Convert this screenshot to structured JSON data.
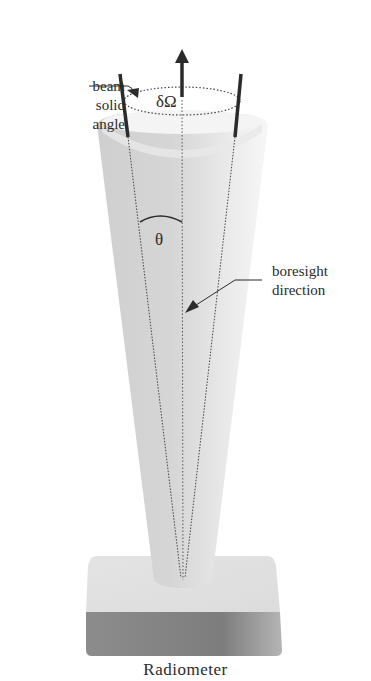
{
  "figure": {
    "type": "radiometer beam geometry diagram",
    "labels": {
      "beam_solid_angle": [
        "beam",
        "solid",
        "angle"
      ],
      "solid_angle_symbol": "δΩ",
      "angle_symbol": "θ",
      "boresight_direction": [
        "boresight",
        "direction"
      ],
      "instrument": "Radiometer"
    },
    "colors": {
      "background": "#ffffff",
      "cone_fill": "#d9d9d9",
      "base_top": "#e2e2e2",
      "base_front": "#8a8a8a",
      "lines": "#2b2b2b"
    }
  }
}
